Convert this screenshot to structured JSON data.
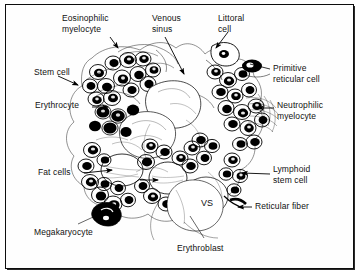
{
  "figure": {
    "style": "black-and-white ink drawing with leader-line callouts",
    "frame_color": "#0d0d0d",
    "background_color": "#ffffff",
    "ink_color": "#000000"
  },
  "labels": [
    {
      "id": "eosinophilic-myelocyte",
      "text": "Eosinophilic\nmyelocyte",
      "x": 62,
      "y": 13,
      "lines": 2,
      "connector": "arrow",
      "side": "top-left"
    },
    {
      "id": "venous-sinus",
      "text": "Venous\nsinus",
      "x": 152,
      "y": 13,
      "lines": 2,
      "connector": "arrow",
      "side": "top-center"
    },
    {
      "id": "littoral-cell",
      "text": "Littoral\ncell",
      "x": 218,
      "y": 13,
      "lines": 2,
      "connector": "arrow",
      "side": "top-right"
    },
    {
      "id": "primitive-reticular-cell",
      "text": "Primitive\nreticular cell",
      "x": 273,
      "y": 63,
      "lines": 2,
      "connector": "line",
      "side": "right"
    },
    {
      "id": "neutrophilic-myelocyte",
      "text": "Neutrophilic\nmyelocyte",
      "x": 277,
      "y": 100,
      "lines": 2,
      "connector": "arrow",
      "side": "right"
    },
    {
      "id": "lymphoid-stem-cell",
      "text": "Lymphoid\nstem cell",
      "x": 273,
      "y": 164,
      "lines": 2,
      "connector": "arrow",
      "side": "right"
    },
    {
      "id": "reticular-fiber",
      "text": "Reticular fiber",
      "x": 255,
      "y": 201,
      "lines": 1,
      "connector": "arrow",
      "side": "right"
    },
    {
      "id": "stem-cell",
      "text": "Stem cell",
      "x": 34,
      "y": 67,
      "lines": 1,
      "connector": "arrow",
      "side": "left"
    },
    {
      "id": "erythrocyte",
      "text": "Erythrocyte",
      "x": 35,
      "y": 100,
      "lines": 1,
      "connector": "arrow",
      "side": "left"
    },
    {
      "id": "fat-cells",
      "text": "Fat cells",
      "x": 38,
      "y": 167,
      "lines": 1,
      "connector": "arrow",
      "side": "left"
    },
    {
      "id": "megakaryocyte",
      "text": "Megakaryocyte",
      "x": 34,
      "y": 227,
      "lines": 1,
      "connector": "line",
      "side": "bottom-left"
    },
    {
      "id": "erythroblast",
      "text": "Erythroblast",
      "x": 177,
      "y": 243,
      "lines": 1,
      "connector": "line",
      "side": "bottom-center"
    }
  ],
  "inline_annotations": [
    {
      "id": "vs-abbreviation",
      "text": "VS",
      "meaning": "venous sinus",
      "x": 201,
      "y": 198
    }
  ]
}
